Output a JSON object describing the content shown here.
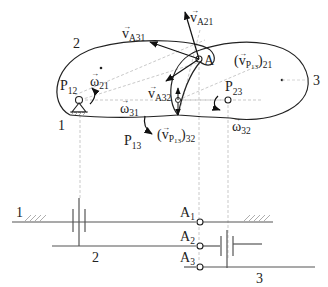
{
  "diagram": {
    "links": {
      "link1_label": "1",
      "link2_label": "2",
      "link3_label": "3"
    },
    "points": {
      "A": "A",
      "P12": {
        "base": "P",
        "sub": "12"
      },
      "P13": {
        "base": "P",
        "sub": "13"
      },
      "P23": {
        "base": "P",
        "sub": "23"
      }
    },
    "vectors": {
      "vA31": {
        "base": "v",
        "sub": "A31"
      },
      "vA21": {
        "base": "v",
        "sub": "A21"
      },
      "vA32": {
        "base": "v",
        "sub": "A32"
      },
      "vP13_21": {
        "open": "(",
        "base": "v",
        "sub": "P",
        "subsub": "13",
        "close": ")",
        "outer": "21"
      },
      "vP13_32": {
        "open": "(",
        "base": "v",
        "sub": "P",
        "subsub": "13",
        "close": ")",
        "outer": "32"
      },
      "w21": {
        "base": "ω",
        "sub": "21"
      },
      "w31": {
        "base": "ω",
        "sub": "31"
      },
      "w32": {
        "base": "ω",
        "sub": "32"
      }
    },
    "bottom_schematic": {
      "ground_label": "1",
      "shaft2_label": "2",
      "shaft3_label": "3",
      "A1": {
        "base": "A",
        "sub": "1"
      },
      "A2": {
        "base": "A",
        "sub": "2"
      },
      "A3": {
        "base": "A",
        "sub": "3"
      }
    }
  }
}
